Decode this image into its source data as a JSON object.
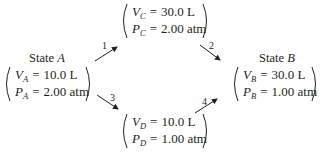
{
  "diagram": {
    "type": "thermodynamic-process-paths",
    "states": {
      "A": {
        "title_prefix": "State",
        "title_letter": "A",
        "volume": {
          "symbol": "V",
          "sub": "A",
          "eq": "=",
          "value": "10.0 L"
        },
        "pressure": {
          "symbol": "P",
          "sub": "A",
          "eq": "=",
          "value": "2.00 atm"
        }
      },
      "B": {
        "title_prefix": "State",
        "title_letter": "B",
        "volume": {
          "symbol": "V",
          "sub": "B",
          "eq": "=",
          "value": "30.0 L"
        },
        "pressure": {
          "symbol": "P",
          "sub": "B",
          "eq": "=",
          "value": "1.00 atm"
        }
      },
      "C": {
        "volume": {
          "symbol": "V",
          "sub": "C",
          "eq": "=",
          "value": "30.0 L"
        },
        "pressure": {
          "symbol": "P",
          "sub": "C",
          "eq": "=",
          "value": "2.00 atm"
        }
      },
      "D": {
        "volume": {
          "symbol": "V",
          "sub": "D",
          "eq": "=",
          "value": "10.0 L"
        },
        "pressure": {
          "symbol": "P",
          "sub": "D",
          "eq": "=",
          "value": "1.00 atm"
        }
      }
    },
    "arrows": [
      {
        "label": "1",
        "from": "A",
        "to": "C"
      },
      {
        "label": "2",
        "from": "C",
        "to": "B"
      },
      {
        "label": "3",
        "from": "A",
        "to": "D"
      },
      {
        "label": "4",
        "from": "D",
        "to": "B"
      }
    ],
    "colors": {
      "ink": "#231f20",
      "background": "#ffffff"
    }
  }
}
